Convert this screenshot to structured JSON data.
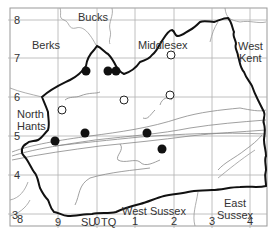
{
  "map": {
    "frame": {
      "x": 10,
      "y": 8,
      "w": 257,
      "h": 218
    },
    "grid": {
      "color": "#b0b0b0",
      "x_lines": [
        {
          "x": 58,
          "label": "9"
        },
        {
          "x": 97,
          "label": "0"
        },
        {
          "x": 135,
          "label": "1"
        },
        {
          "x": 174,
          "label": "2"
        },
        {
          "x": 212,
          "label": "3"
        },
        {
          "x": 250,
          "label": "4"
        }
      ],
      "y_lines": [
        {
          "y": 20,
          "label": "8"
        },
        {
          "y": 58,
          "label": "7"
        },
        {
          "y": 97,
          "label": "6"
        },
        {
          "y": 136,
          "label": "5"
        },
        {
          "y": 175,
          "label": "4"
        },
        {
          "y": 214,
          "label": "3"
        }
      ],
      "corner_x_label": "8",
      "grid_ref_left": "SU",
      "grid_ref_right": "TQ"
    },
    "region_labels": [
      {
        "text": "Bucks",
        "x": 78,
        "y": 11
      },
      {
        "text": "Berks",
        "x": 32,
        "y": 39
      },
      {
        "text": "Middlesex",
        "x": 138,
        "y": 39
      },
      {
        "text": "West",
        "x": 238,
        "y": 40
      },
      {
        "text": "Kent",
        "x": 239,
        "y": 52
      },
      {
        "text": "North",
        "x": 17,
        "y": 108
      },
      {
        "text": "Hants",
        "x": 17,
        "y": 120
      },
      {
        "text": "West Sussex",
        "x": 122,
        "y": 205
      },
      {
        "text": "East",
        "x": 224,
        "y": 197
      },
      {
        "text": "Sussex",
        "x": 217,
        "y": 209
      }
    ],
    "records": {
      "filled": [
        {
          "x": 86,
          "y": 71
        },
        {
          "x": 108,
          "y": 71
        },
        {
          "x": 116,
          "y": 71
        },
        {
          "x": 55,
          "y": 141
        },
        {
          "x": 85,
          "y": 133
        },
        {
          "x": 147,
          "y": 133
        },
        {
          "x": 162,
          "y": 149
        }
      ],
      "open": [
        {
          "x": 171,
          "y": 55
        },
        {
          "x": 124,
          "y": 100
        },
        {
          "x": 62,
          "y": 110
        },
        {
          "x": 170,
          "y": 95
        }
      ],
      "fill_color": "#111111",
      "open_stroke": "#222222"
    },
    "boundary_color": "#111111",
    "river_color": "#888888"
  }
}
